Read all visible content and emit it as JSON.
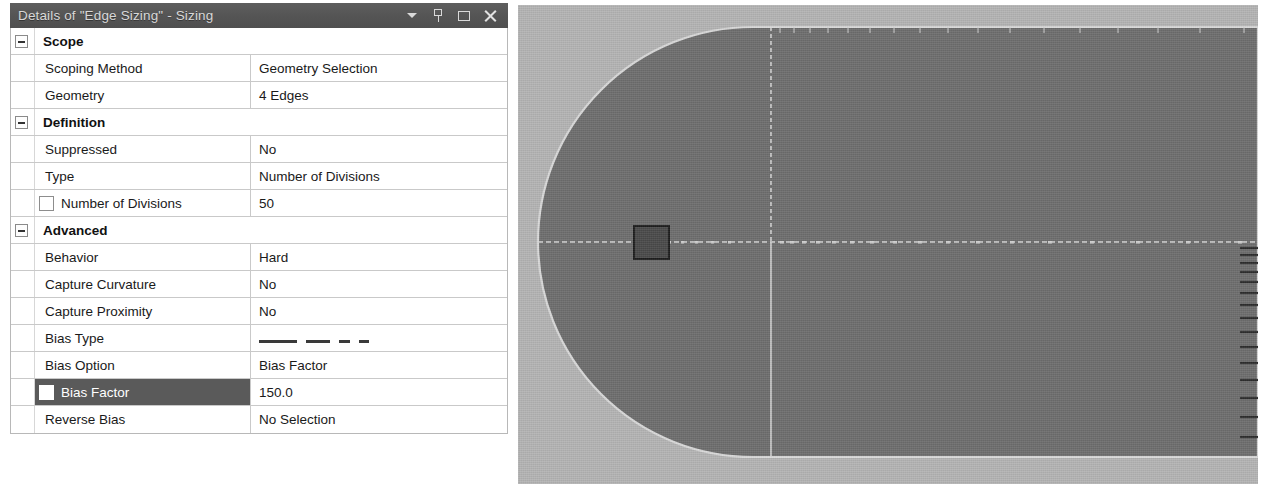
{
  "panel": {
    "title": "Details of \"Edge Sizing\" - Sizing",
    "titlebar_icons": [
      {
        "name": "dropdown-caret-icon",
        "glyph": "caret"
      },
      {
        "name": "auto-hide-pin-icon",
        "glyph": "pin"
      },
      {
        "name": "maximize-restore-icon",
        "glyph": "restore"
      },
      {
        "name": "close-icon",
        "glyph": "close"
      }
    ],
    "colors": {
      "titlebar_bg": "#585858",
      "titlebar_text": "#d8d8d8",
      "row_border": "#c9c9c9",
      "selected_row_bg": "#5a5a5a",
      "selected_row_text": "#ffffff",
      "viewport_bg": "#b4b4b4",
      "mesh_fill": "#6e6e6e",
      "mesh_edge": "#d7d7d7",
      "body_fill": "#4a4a4a"
    },
    "rows": [
      {
        "kind": "group",
        "label": "Scope",
        "expander": "minus"
      },
      {
        "kind": "prop",
        "name": "Scoping Method",
        "value": "Geometry Selection"
      },
      {
        "kind": "prop",
        "name": "Geometry",
        "value": "4 Edges"
      },
      {
        "kind": "group",
        "label": "Definition",
        "expander": "minus"
      },
      {
        "kind": "prop",
        "name": "Suppressed",
        "value": "No"
      },
      {
        "kind": "prop",
        "name": "Type",
        "value": "Number of Divisions"
      },
      {
        "kind": "check",
        "name": "Number of Divisions",
        "value": "50",
        "checked": false,
        "selected": false
      },
      {
        "kind": "group",
        "label": "Advanced",
        "expander": "minus"
      },
      {
        "kind": "prop",
        "name": "Behavior",
        "value": "Hard"
      },
      {
        "kind": "prop",
        "name": "Capture Curvature",
        "value": "No"
      },
      {
        "kind": "prop",
        "name": "Capture Proximity",
        "value": "No"
      },
      {
        "kind": "graphic",
        "name": "Bias Type",
        "value": "",
        "graphic": "bias-dashes-decreasing"
      },
      {
        "kind": "prop",
        "name": "Bias Option",
        "value": "Bias Factor"
      },
      {
        "kind": "check",
        "name": "Bias Factor",
        "value": "150.0",
        "checked": false,
        "selected": true
      },
      {
        "kind": "prop",
        "name": "Reverse Bias",
        "value": "No Selection"
      }
    ]
  },
  "viewport": {
    "name": "mesh-graphics-viewport",
    "description": "C-grid mesh around a square body",
    "body_label": "square-body"
  }
}
